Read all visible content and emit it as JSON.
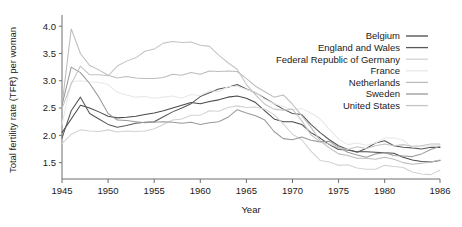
{
  "chart_data": {
    "type": "line",
    "title": "",
    "xlabel": "Year",
    "ylabel": "Total fertility rate (TFR) per woman",
    "xlim": [
      1945,
      1986
    ],
    "ylim": [
      1.2,
      4.15
    ],
    "grid": false,
    "legend_position": "top-right",
    "xticks": [
      1945,
      1950,
      1955,
      1960,
      1965,
      1970,
      1975,
      1980,
      1986
    ],
    "xticklabels": [
      "1945",
      "1950",
      "1955",
      "1960",
      "1965",
      "1970",
      "1975",
      "1980",
      "1986"
    ],
    "yticks": [
      1.5,
      2.0,
      2.5,
      3.0,
      3.5,
      4.0
    ],
    "yticklabels": [
      "1.5",
      "2.0",
      "2.5",
      "3.0",
      "3.5",
      "4.0"
    ],
    "x": [
      1945,
      1946,
      1947,
      1948,
      1949,
      1950,
      1951,
      1952,
      1953,
      1954,
      1955,
      1956,
      1957,
      1958,
      1959,
      1960,
      1961,
      1962,
      1963,
      1964,
      1965,
      1966,
      1967,
      1968,
      1969,
      1970,
      1971,
      1972,
      1973,
      1974,
      1975,
      1976,
      1977,
      1978,
      1979,
      1980,
      1981,
      1982,
      1983,
      1984,
      1985,
      1986
    ],
    "series": [
      {
        "name": "Belgium",
        "color": "#4a4a4a",
        "values": [
          2.05,
          2.3,
          2.55,
          2.5,
          2.43,
          2.35,
          2.32,
          2.33,
          2.35,
          2.38,
          2.41,
          2.45,
          2.5,
          2.55,
          2.6,
          2.58,
          2.62,
          2.65,
          2.7,
          2.72,
          2.68,
          2.6,
          2.45,
          2.3,
          2.25,
          2.25,
          2.2,
          2.05,
          1.95,
          1.83,
          1.74,
          1.73,
          1.7,
          1.7,
          1.69,
          1.68,
          1.67,
          1.6,
          1.55,
          1.52,
          1.51,
          1.54
        ]
      },
      {
        "name": "England and Wales",
        "color": "#585858",
        "values": [
          1.95,
          2.45,
          2.7,
          2.4,
          2.3,
          2.2,
          2.15,
          2.18,
          2.22,
          2.24,
          2.25,
          2.34,
          2.43,
          2.5,
          2.58,
          2.71,
          2.78,
          2.85,
          2.88,
          2.93,
          2.85,
          2.78,
          2.68,
          2.58,
          2.48,
          2.4,
          2.38,
          2.2,
          2.05,
          1.92,
          1.81,
          1.74,
          1.69,
          1.76,
          1.86,
          1.9,
          1.81,
          1.78,
          1.77,
          1.75,
          1.78,
          1.78
        ]
      },
      {
        "name": "Federal Republic of Germany",
        "color": "#d2d2d2",
        "values": [
          1.85,
          2.02,
          2.1,
          2.08,
          2.07,
          2.1,
          2.06,
          2.08,
          2.07,
          2.08,
          2.12,
          2.2,
          2.28,
          2.3,
          2.37,
          2.37,
          2.45,
          2.44,
          2.51,
          2.54,
          2.51,
          2.52,
          2.48,
          2.38,
          2.21,
          2.02,
          1.92,
          1.71,
          1.54,
          1.51,
          1.45,
          1.46,
          1.4,
          1.38,
          1.38,
          1.45,
          1.43,
          1.41,
          1.33,
          1.29,
          1.28,
          1.36
        ]
      },
      {
        "name": "France",
        "color": "#e8e8e8",
        "values": [
          2.2,
          2.98,
          3.0,
          2.98,
          2.97,
          2.93,
          2.79,
          2.74,
          2.7,
          2.71,
          2.68,
          2.7,
          2.72,
          2.68,
          2.75,
          2.73,
          2.82,
          2.8,
          2.89,
          2.9,
          2.84,
          2.79,
          2.66,
          2.58,
          2.53,
          2.47,
          2.49,
          2.41,
          2.3,
          2.11,
          1.93,
          1.83,
          1.86,
          1.82,
          1.86,
          1.95,
          1.95,
          1.91,
          1.78,
          1.8,
          1.81,
          1.83
        ]
      },
      {
        "name": "Netherlands",
        "color": "#bcbcbc",
        "values": [
          2.55,
          3.95,
          3.5,
          3.28,
          3.2,
          3.1,
          3.05,
          3.08,
          3.05,
          3.04,
          3.04,
          3.06,
          3.12,
          3.1,
          3.15,
          3.12,
          3.18,
          3.17,
          3.18,
          3.17,
          3.04,
          2.9,
          2.8,
          2.7,
          2.74,
          2.57,
          2.36,
          2.15,
          1.9,
          1.77,
          1.66,
          1.63,
          1.58,
          1.58,
          1.56,
          1.6,
          1.56,
          1.5,
          1.47,
          1.49,
          1.51,
          1.55
        ]
      },
      {
        "name": "Sweden",
        "color": "#9a9a9a",
        "values": [
          2.55,
          3.25,
          3.15,
          2.95,
          2.7,
          2.4,
          2.28,
          2.27,
          2.25,
          2.23,
          2.24,
          2.25,
          2.24,
          2.22,
          2.24,
          2.2,
          2.23,
          2.25,
          2.33,
          2.47,
          2.41,
          2.36,
          2.28,
          2.07,
          1.94,
          1.92,
          1.97,
          1.91,
          1.88,
          1.89,
          1.78,
          1.69,
          1.64,
          1.6,
          1.66,
          1.68,
          1.63,
          1.62,
          1.61,
          1.66,
          1.74,
          1.8
        ]
      },
      {
        "name": "United States",
        "color": "#c4c4c4",
        "values": [
          2.49,
          2.94,
          3.27,
          3.11,
          3.11,
          3.09,
          3.27,
          3.36,
          3.42,
          3.54,
          3.58,
          3.69,
          3.72,
          3.7,
          3.71,
          3.65,
          3.63,
          3.47,
          3.33,
          3.21,
          2.93,
          2.74,
          2.57,
          2.48,
          2.46,
          2.48,
          2.27,
          2.01,
          1.88,
          1.84,
          1.77,
          1.74,
          1.79,
          1.76,
          1.81,
          1.84,
          1.81,
          1.83,
          1.8,
          1.81,
          1.84,
          1.84
        ]
      }
    ]
  }
}
